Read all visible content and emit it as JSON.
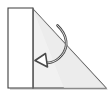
{
  "figure": {
    "canvas": {
      "width": 112,
      "height": 99,
      "background": "#ffffff"
    },
    "colors": {
      "triangle_fill": "#f1f1f1",
      "flap_fill": "#ffffff",
      "outline": "#3c3c3c",
      "crease_line": "#6e6e6e",
      "arrow_stroke": "#4a4a4a",
      "arrow_fill": "#ffffff",
      "shadow": "#b9b9b9"
    },
    "shapes": {
      "triangle": {
        "name": "right-triangle-sheet",
        "points": "33,9 106,88 33,88",
        "label": "Triangle body"
      },
      "flap": {
        "name": "rectangular-fold-flap",
        "points": "8,8 33,8 33,88 8,88",
        "label": "Folded flap"
      },
      "crease": {
        "name": "fold-crease-line",
        "x1": 33,
        "y1": 8,
        "x2": 33,
        "y2": 88,
        "label": "Crease"
      },
      "arrow": {
        "name": "fold-direction-arrow",
        "path": "M 57.5 25.5 C 66 34 67.5 45.5 61 54 C 55 62 46.5 64.5 40.5 61.5",
        "head_points": "44.5,54.5 35.5,60.5 46.5,66.5",
        "label": "Fold direction"
      }
    },
    "labels": {
      "caption": ""
    }
  }
}
